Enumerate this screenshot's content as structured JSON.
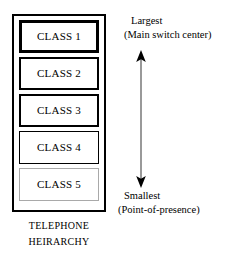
{
  "figure": {
    "caption": {
      "line1": "TELEPHONE",
      "line2": "HEIRARCHY"
    }
  },
  "hierarchy": {
    "classes": [
      {
        "label": "CLASS 1",
        "weight": "w1"
      },
      {
        "label": "CLASS 2",
        "weight": "w2"
      },
      {
        "label": "CLASS 3",
        "weight": "w3"
      },
      {
        "label": "CLASS 4",
        "weight": "w4"
      },
      {
        "label": "CLASS 5",
        "weight": "w5"
      }
    ]
  },
  "scale": {
    "top": {
      "title": "Largest",
      "detail": "(Main switch center)"
    },
    "bottom": {
      "title": "Smallest",
      "detail": "(Point-of-presence)"
    },
    "arrow": "double-headed-vertical-arrow"
  },
  "colors": {
    "ink": "#000000",
    "paper": "#ffffff",
    "faint_border": "#a9a9a9"
  }
}
